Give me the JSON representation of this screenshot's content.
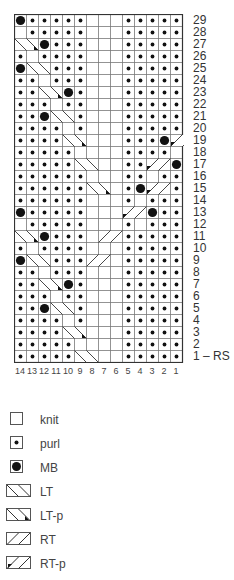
{
  "chart_title": "",
  "grid": {
    "columns": 14,
    "rows": 29,
    "cell_px": 12,
    "column_labels": [
      "14",
      "13",
      "12",
      "11",
      "10",
      "9",
      "8",
      "7",
      "6",
      "5",
      "4",
      "3",
      "2",
      "1"
    ],
    "row_labels": [
      "29",
      "28",
      "27",
      "26",
      "25",
      "24",
      "23",
      "22",
      "21",
      "20",
      "19",
      "18",
      "17",
      "16",
      "15",
      "14",
      "13",
      "12",
      "11",
      "10",
      "9",
      "8",
      "7",
      "6",
      "5",
      "4",
      "3",
      "2",
      "1 – RS"
    ],
    "rows_top_to_bottom": [
      [
        "M",
        "P",
        "P",
        "P",
        "P",
        "P",
        "K",
        "K",
        "K",
        "P",
        "P",
        "P",
        "P",
        "P",
        "P"
      ],
      [
        "K",
        "P",
        "P",
        "P",
        "P",
        "P",
        "K",
        "K",
        "K",
        "P",
        "P",
        "P",
        "P",
        "P",
        "P"
      ],
      [
        "LT-p",
        "LT-p",
        "M",
        "P",
        "P",
        "P",
        "K",
        "K",
        "K",
        "P",
        "P",
        "P",
        "P",
        "P",
        "P"
      ],
      [
        "P",
        "K",
        "P",
        "P",
        "P",
        "P",
        "K",
        "K",
        "K",
        "P",
        "P",
        "P",
        "P",
        "P",
        "P"
      ],
      [
        "M",
        "LT",
        "LT",
        "P",
        "P",
        "P",
        "K",
        "K",
        "K",
        "P",
        "P",
        "P",
        "P",
        "P",
        "P"
      ],
      [
        "P",
        "P",
        "K",
        "P",
        "P",
        "P",
        "K",
        "K",
        "K",
        "P",
        "P",
        "P",
        "P",
        "P",
        "P"
      ],
      [
        "P",
        "P",
        "LT-p",
        "LT-p",
        "M",
        "P",
        "K",
        "K",
        "K",
        "P",
        "P",
        "P",
        "P",
        "P",
        "P"
      ],
      [
        "P",
        "P",
        "P",
        "K",
        "P",
        "P",
        "K",
        "K",
        "K",
        "P",
        "P",
        "P",
        "P",
        "P",
        "P"
      ],
      [
        "P",
        "P",
        "M",
        "LT",
        "LT",
        "P",
        "K",
        "K",
        "K",
        "P",
        "P",
        "P",
        "P",
        "P",
        "M"
      ],
      [
        "P",
        "P",
        "P",
        "P",
        "K",
        "P",
        "K",
        "K",
        "K",
        "P",
        "P",
        "P",
        "P",
        "P",
        "K"
      ],
      [
        "P",
        "P",
        "P",
        "P",
        "LT-p",
        "LT-p",
        "K",
        "K",
        "K",
        "P",
        "P",
        "P",
        "M",
        "RT-p",
        "RT-p"
      ],
      [
        "P",
        "P",
        "P",
        "P",
        "P",
        "K",
        "K",
        "K",
        "K",
        "P",
        "P",
        "P",
        "P",
        "K",
        "P"
      ],
      [
        "P",
        "P",
        "P",
        "P",
        "P",
        "LT",
        "LT",
        "K",
        "K",
        "P",
        "P",
        "RT-p",
        "RT-p",
        "M",
        "P"
      ],
      [
        "P",
        "P",
        "P",
        "P",
        "P",
        "P",
        "K",
        "K",
        "K",
        "P",
        "P",
        "K",
        "P",
        "P",
        "P"
      ],
      [
        "P",
        "P",
        "P",
        "P",
        "P",
        "P",
        "LT-p",
        "LT-p",
        "K",
        "P",
        "M",
        "RT-p",
        "RT-p",
        "P",
        "P"
      ],
      [
        "P",
        "P",
        "P",
        "P",
        "P",
        "P",
        "K",
        "K",
        "K",
        "P",
        "K",
        "P",
        "P",
        "P",
        "P"
      ],
      [
        "M",
        "P",
        "P",
        "P",
        "P",
        "P",
        "K",
        "K",
        "K",
        "RT-p",
        "RT-p",
        "M",
        "P",
        "P",
        "P"
      ],
      [
        "K",
        "P",
        "P",
        "P",
        "P",
        "P",
        "K",
        "K",
        "K",
        "P",
        "K",
        "P",
        "P",
        "P",
        "P"
      ],
      [
        "LT-p",
        "LT-p",
        "M",
        "P",
        "P",
        "P",
        "K",
        "RT",
        "RT",
        "P",
        "P",
        "P",
        "P",
        "P",
        "P"
      ],
      [
        "P",
        "K",
        "P",
        "P",
        "P",
        "P",
        "K",
        "K",
        "K",
        "P",
        "P",
        "P",
        "P",
        "P",
        "P"
      ],
      [
        "M",
        "LT",
        "LT",
        "P",
        "P",
        "P",
        "RT",
        "RT",
        "K",
        "P",
        "P",
        "P",
        "P",
        "P",
        "P"
      ],
      [
        "P",
        "P",
        "K",
        "P",
        "P",
        "P",
        "K",
        "K",
        "K",
        "P",
        "P",
        "P",
        "P",
        "P",
        "P"
      ],
      [
        "P",
        "P",
        "LT-p",
        "LT-p",
        "M",
        "P",
        "K",
        "K",
        "K",
        "P",
        "P",
        "P",
        "P",
        "P",
        "P"
      ],
      [
        "P",
        "P",
        "P",
        "K",
        "P",
        "P",
        "K",
        "K",
        "K",
        "P",
        "P",
        "P",
        "P",
        "P",
        "P"
      ],
      [
        "P",
        "P",
        "M",
        "LT",
        "LT",
        "P",
        "K",
        "K",
        "K",
        "P",
        "P",
        "P",
        "P",
        "P",
        "P"
      ],
      [
        "P",
        "P",
        "P",
        "P",
        "K",
        "P",
        "K",
        "K",
        "K",
        "P",
        "P",
        "P",
        "P",
        "P",
        "P"
      ],
      [
        "P",
        "P",
        "P",
        "P",
        "LT-p",
        "LT-p",
        "K",
        "K",
        "K",
        "P",
        "P",
        "P",
        "P",
        "P",
        "P"
      ],
      [
        "P",
        "P",
        "P",
        "P",
        "P",
        "K",
        "K",
        "K",
        "K",
        "P",
        "P",
        "P",
        "P",
        "P",
        "P"
      ],
      [
        "P",
        "P",
        "P",
        "P",
        "P",
        "LT",
        "LT",
        "K",
        "K",
        "P",
        "P",
        "P",
        "P",
        "P",
        "P"
      ]
    ]
  },
  "legend": [
    {
      "symbol": "knit",
      "label": "knit"
    },
    {
      "symbol": "purl",
      "label": "purl"
    },
    {
      "symbol": "mb",
      "label": "MB"
    },
    {
      "symbol": "lt",
      "label": "LT"
    },
    {
      "symbol": "lt-p",
      "label": "LT-p"
    },
    {
      "symbol": "rt",
      "label": "RT"
    },
    {
      "symbol": "rt-p",
      "label": "RT-p"
    }
  ]
}
